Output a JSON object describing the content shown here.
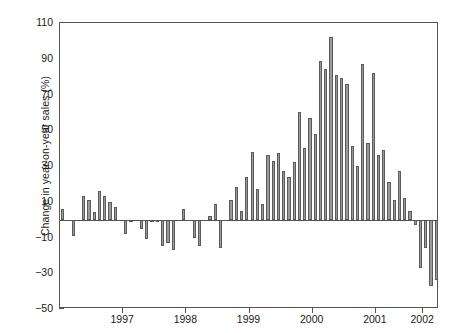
{
  "chart_data": {
    "type": "bar",
    "title": "",
    "subtitle": "",
    "xlabel": "",
    "ylabel": "Change in year-on-year sales (%)",
    "ylim": [
      -50,
      110
    ],
    "yticks": [
      110,
      90,
      70,
      50,
      30,
      10,
      -10,
      -30,
      -50
    ],
    "ytick_labels": [
      "110",
      "90",
      "70",
      "50",
      "30",
      "10",
      "−10",
      "−30",
      "−50"
    ],
    "xlim": [
      "1996-07",
      "2002-08"
    ],
    "xticks": [
      "1997",
      "1998",
      "1999",
      "2000",
      "2001",
      "2002"
    ],
    "xtick_labels": [
      "1997",
      "1998",
      "1999",
      "2000",
      "2001",
      "2002"
    ],
    "grid": false,
    "legend": false,
    "zero_line": true,
    "bar_fill": "#9a9a9a",
    "bar_edge": "#5a5a5a",
    "axis_color": "#555555",
    "background": "#ffffff",
    "categories": [
      "1996-07",
      "1996-08",
      "1996-09",
      "1996-10",
      "1996-11",
      "1996-12",
      "1997-01",
      "1997-02",
      "1997-03",
      "1997-04",
      "1997-05",
      "1997-06",
      "1997-07",
      "1997-08",
      "1997-09",
      "1997-10",
      "1997-11",
      "1997-12",
      "1998-01",
      "1998-02",
      "1998-03",
      "1998-04",
      "1998-05",
      "1998-06",
      "1998-07",
      "1998-08",
      "1998-09",
      "1998-10",
      "1998-11",
      "1998-12",
      "1999-01",
      "1999-02",
      "1999-03",
      "1999-04",
      "1999-05",
      "1999-06",
      "1999-07",
      "1999-08",
      "1999-09",
      "1999-10",
      "1999-11",
      "1999-12",
      "2000-01",
      "2000-02",
      "2000-03",
      "2000-04",
      "2000-05",
      "2000-06",
      "2000-07",
      "2000-08",
      "2000-09",
      "2000-10",
      "2000-11",
      "2000-12",
      "2001-01",
      "2001-02",
      "2001-03",
      "2001-04",
      "2001-05",
      "2001-06",
      "2001-07",
      "2001-08",
      "2001-09",
      "2001-10",
      "2001-11",
      "2001-12",
      "2002-01",
      "2002-02",
      "2002-03",
      "2002-04",
      "2002-05",
      "2002-06"
    ],
    "values": [
      6,
      0,
      -9,
      0,
      13,
      11,
      4,
      16,
      13,
      10,
      7,
      0,
      -8,
      -1,
      0,
      -5,
      -11,
      -1,
      -1,
      -15,
      -13,
      -17,
      0,
      6,
      0,
      -10,
      -15,
      0,
      2,
      9,
      -16,
      0,
      11,
      18,
      5,
      24,
      38,
      17,
      9,
      36,
      33,
      37,
      27,
      24,
      32,
      60,
      40,
      57,
      48,
      89,
      84,
      102,
      81,
      79,
      76,
      41,
      30,
      87,
      43,
      82,
      36,
      39,
      21,
      11,
      27,
      12,
      5,
      -3,
      -27,
      -16,
      -37,
      -34
    ],
    "extra_values": [
      -45,
      -36,
      -43,
      -47,
      -34,
      -31,
      -26,
      -33,
      -21
    ],
    "series": [
      {
        "name": "Change in year-on-year sales (%)",
        "values": [
          6,
          0,
          -9,
          0,
          13,
          11,
          4,
          16,
          13,
          10,
          7,
          0,
          -8,
          -1,
          0,
          -5,
          -11,
          -1,
          -1,
          -15,
          -13,
          -17,
          0,
          6,
          0,
          -10,
          -15,
          0,
          2,
          9,
          -16,
          0,
          11,
          18,
          5,
          24,
          38,
          17,
          9,
          36,
          33,
          37,
          27,
          24,
          32,
          60,
          40,
          57,
          48,
          89,
          84,
          102,
          81,
          79,
          76,
          41,
          30,
          87,
          43,
          82,
          36,
          39,
          21,
          11,
          27,
          12,
          5,
          -3,
          -27,
          -16,
          -37,
          -34
        ]
      }
    ]
  }
}
